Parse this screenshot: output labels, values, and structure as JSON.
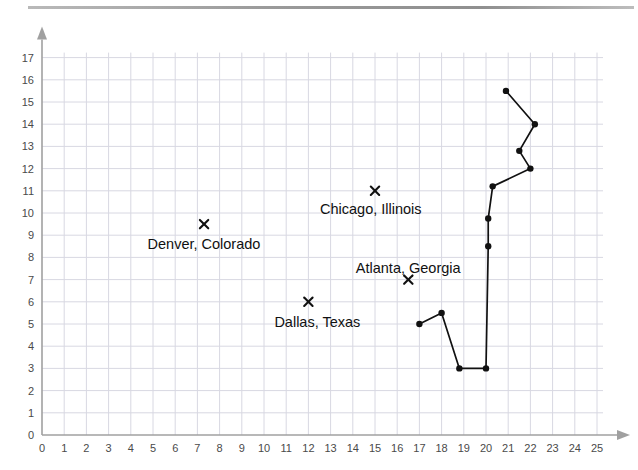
{
  "figure": {
    "top_rule_color": "#9a9a9a",
    "background_color": "#ffffff",
    "grid_color": "#d8d8e2",
    "axis_color": "#a0a0a0",
    "data_color": "#111111"
  },
  "chart_data": {
    "type": "scatter",
    "title": "",
    "xlabel": "",
    "ylabel": "",
    "xlim": [
      0,
      25
    ],
    "ylim": [
      0,
      17
    ],
    "grid": true,
    "legend": "none",
    "xticks": [
      0,
      1,
      2,
      3,
      4,
      5,
      6,
      7,
      8,
      9,
      10,
      11,
      12,
      13,
      14,
      15,
      16,
      17,
      18,
      19,
      20,
      21,
      22,
      23,
      24,
      25
    ],
    "xtick_labels": [
      "0",
      "1",
      "2",
      "3",
      "4",
      "5",
      "6",
      "7",
      "8",
      "9",
      "10",
      "11",
      "12",
      "13",
      "14",
      "15",
      "16",
      "17",
      "18",
      "19",
      "20",
      "21",
      "22",
      "23",
      "24",
      "25"
    ],
    "yticks": [
      0,
      1,
      2,
      3,
      4,
      5,
      6,
      7,
      8,
      9,
      10,
      11,
      12,
      13,
      14,
      15,
      16,
      17
    ],
    "ytick_labels": [
      "0",
      "1",
      "2",
      "3",
      "4",
      "5",
      "6",
      "7",
      "8",
      "9",
      "10",
      "11",
      "12",
      "13",
      "14",
      "15",
      "16",
      "17"
    ],
    "series": [
      {
        "name": "cities",
        "marker": "x",
        "points": [
          {
            "label": "Chicago, Illinois",
            "x": 15,
            "y": 11,
            "label_dx": -4,
            "label_dy": 18,
            "label_anchor": "middle"
          },
          {
            "label": "Denver, Colorado",
            "x": 7.3,
            "y": 9.5,
            "label_dx": 0,
            "label_dy": 20,
            "label_anchor": "middle"
          },
          {
            "label": "Atlanta, Georgia",
            "x": 16.5,
            "y": 7,
            "label_dx": 0,
            "label_dy": -12,
            "label_anchor": "middle"
          },
          {
            "label": "Dallas, Texas",
            "x": 12,
            "y": 6,
            "label_dx": 9,
            "label_dy": 20,
            "label_anchor": "middle"
          }
        ]
      },
      {
        "name": "route-path",
        "marker": "dot",
        "connected": true,
        "points": [
          {
            "x": 17.0,
            "y": 5.0
          },
          {
            "x": 18.0,
            "y": 5.5
          },
          {
            "x": 18.8,
            "y": 3.0
          },
          {
            "x": 20.0,
            "y": 3.0
          },
          {
            "x": 20.1,
            "y": 8.5
          },
          {
            "x": 20.1,
            "y": 9.75
          },
          {
            "x": 20.3,
            "y": 11.2
          },
          {
            "x": 22.0,
            "y": 12.0
          },
          {
            "x": 21.5,
            "y": 12.8
          },
          {
            "x": 22.2,
            "y": 14.0
          },
          {
            "x": 20.9,
            "y": 15.5
          }
        ]
      }
    ]
  }
}
